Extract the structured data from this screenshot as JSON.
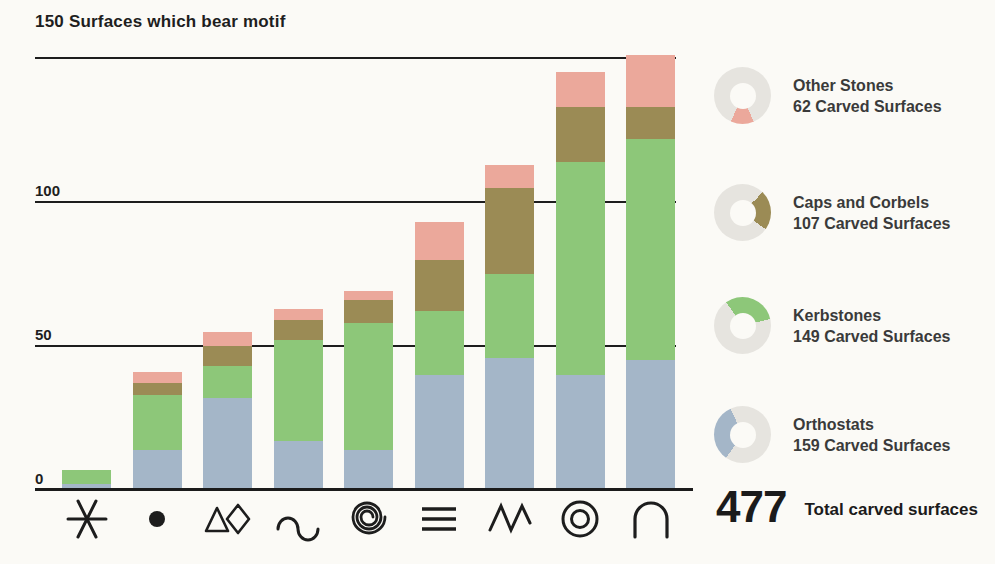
{
  "title": "150 Surfaces which bear motif",
  "colors": {
    "background": "#fbfaf6",
    "axis": "#1d1d1d",
    "text": "#232323",
    "donut_ring_gray": "#e6e4df",
    "orthostats_blue": "#a4b6c8",
    "kerbstones_green": "#8dc779",
    "caps_olive": "#9b8b55",
    "other_pink": "#eba89b"
  },
  "chart_data": {
    "type": "bar",
    "stacked": true,
    "title": "150 Surfaces which bear motif",
    "xlabel": "motif symbols",
    "ylabel": "Surfaces which bear motif",
    "ylim": [
      0,
      150
    ],
    "yticks": [
      0,
      50,
      100,
      150
    ],
    "grid": true,
    "legend_position": "right",
    "categories": [
      "six-point-star",
      "dot",
      "triangle-and-lozenge",
      "serpentine",
      "spiral",
      "parallel-lines",
      "zigzag",
      "concentric-circles",
      "arc"
    ],
    "series": [
      {
        "name": "Orthostats",
        "color": "#a4b6c8",
        "values": [
          2,
          14,
          32,
          17,
          14,
          40,
          46,
          40,
          45
        ]
      },
      {
        "name": "Kerbstones",
        "color": "#8dc779",
        "values": [
          5,
          19,
          11,
          35,
          44,
          22,
          29,
          74,
          77
        ]
      },
      {
        "name": "Caps and Corbels",
        "color": "#9b8b55",
        "values": [
          0,
          4,
          7,
          7,
          8,
          18,
          30,
          19,
          11
        ]
      },
      {
        "name": "Other Stones",
        "color": "#eba89b",
        "values": [
          0,
          4,
          5,
          4,
          3,
          13,
          8,
          12,
          18
        ]
      }
    ],
    "bar_totals": [
      7,
      41,
      55,
      63,
      69,
      93,
      113,
      145,
      151
    ]
  },
  "axis": {
    "visible_tick_labels": [
      "0",
      "50",
      "100"
    ]
  },
  "legend": {
    "items": [
      {
        "name": "Other Stones",
        "count_label": "62 Carved Surfaces",
        "value": 62,
        "color": "#eba89b",
        "arc_deg": 47,
        "arc_start_deg": 157
      },
      {
        "name": "Caps and Corbels",
        "count_label": "107 Carved Surfaces",
        "value": 107,
        "color": "#9b8b55",
        "arc_deg": 81,
        "arc_start_deg": 45
      },
      {
        "name": "Kerbstones",
        "count_label": "149 Carved Surfaces",
        "value": 149,
        "color": "#8dc779",
        "arc_deg": 112,
        "arc_start_deg": -35
      },
      {
        "name": "Orthostats",
        "count_label": "159 Carved Surfaces",
        "value": 159,
        "color": "#a4b6c8",
        "arc_deg": 120,
        "arc_start_deg": 215
      }
    ]
  },
  "total": {
    "value": "477",
    "label": "Total carved surfaces"
  }
}
